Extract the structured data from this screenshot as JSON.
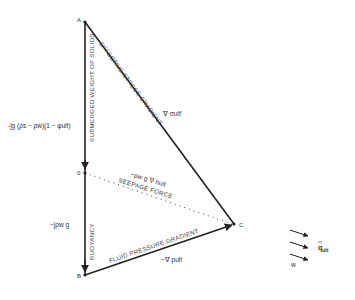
{
  "diagram": {
    "points": {
      "A": {
        "label": "A",
        "x": 85,
        "y": 22
      },
      "O": {
        "label": "0",
        "x": 85,
        "y": 173
      },
      "B": {
        "label": "B",
        "x": 85,
        "y": 275
      },
      "C": {
        "label": "C",
        "x": 234,
        "y": 224
      }
    },
    "edges": {
      "AB_label": "SUBMERGED WEIGHT OF SOLIDS",
      "AC_label": "EFFECTIVE STRESS GRADIENT",
      "OC_label": "SEEPAGE FORCE",
      "OB_label": "BUOYANCY",
      "BC_label": "FLUID PRESSURE GRADIENT"
    },
    "expressions": {
      "submerged_weight": "-ĵg (ρs − ρw)(1 − φult)",
      "effective_stress": "∇ σult'",
      "seepage": "−ρw g ∇ hult",
      "buoyancy": "−ĵρw g",
      "fluid_pressure": "−∇ pult"
    },
    "legend": {
      "flux_label": "q",
      "flux_sub": "ult",
      "arrow_count": 3,
      "small_mark": "w"
    },
    "colors": {
      "line": "#222222",
      "text": "#333333",
      "background": "#ffffff"
    }
  }
}
